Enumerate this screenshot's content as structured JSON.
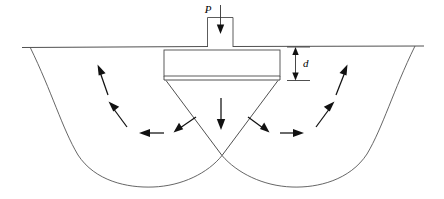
{
  "figure": {
    "width": 444,
    "height": 199,
    "background_color": "#ffffff",
    "line_color": "#3c3c3c",
    "curve_color": "#555555",
    "arrow_color": "#111111"
  },
  "labels": {
    "load": "P",
    "depth": "d"
  },
  "elements": {
    "ground_line_name": "ground-surface-line",
    "column_name": "column-stem",
    "footing_name": "footing-base",
    "wedge_name": "active-wedge",
    "left_failure_surface_name": "left-failure-surface",
    "right_failure_surface_name": "right-failure-surface",
    "depth_dimension_name": "depth-dimension-d",
    "load_arrow_name": "applied-load-arrow"
  },
  "flow_arrows": [
    {
      "name": "arrow-center-down",
      "direction": "down"
    },
    {
      "name": "arrow-left-lower-inward",
      "direction": "down-left"
    },
    {
      "name": "arrow-left-horizontal",
      "direction": "left"
    },
    {
      "name": "arrow-left-mid-up",
      "direction": "up-left"
    },
    {
      "name": "arrow-left-upper-up",
      "direction": "up-left"
    },
    {
      "name": "arrow-right-lower-inward",
      "direction": "down-right"
    },
    {
      "name": "arrow-right-horizontal",
      "direction": "right"
    },
    {
      "name": "arrow-right-mid-up",
      "direction": "up-right"
    },
    {
      "name": "arrow-right-upper-up",
      "direction": "up-right"
    }
  ],
  "geometry": {
    "ground_y": 47,
    "footing_top_y": 50,
    "footing_bottom_y": 80,
    "footing_left_x": 164,
    "footing_right_x": 280,
    "column_left_x": 207,
    "column_right_x": 233,
    "column_top_y": 17,
    "wedge_apex_x": 222,
    "wedge_apex_y": 155,
    "curve_bottom_y": 187,
    "left_surface_start_x": 30,
    "right_surface_start_x": 415
  }
}
